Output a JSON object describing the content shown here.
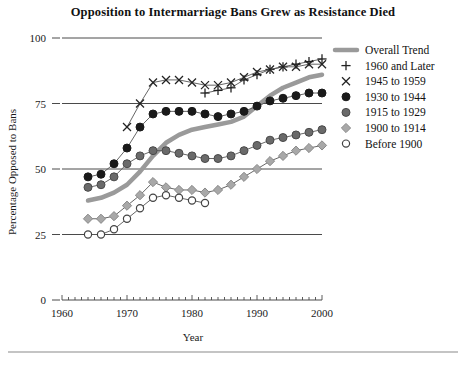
{
  "chart_data": {
    "type": "line",
    "title": "Opposition to Intermarriage Bans Grew as Resistance Died",
    "xlabel": "Year",
    "ylabel": "Percentage Opposed to Bans",
    "xlim": [
      1960,
      2000
    ],
    "ylim": [
      0,
      100
    ],
    "xticks": [
      1960,
      1970,
      1980,
      1990,
      2000
    ],
    "xtick_labels": [
      "1960",
      "1970",
      "1980",
      "1990",
      "2000"
    ],
    "yticks": [
      0,
      25,
      50,
      75,
      100
    ],
    "ytick_labels": [
      "0",
      "25",
      "50",
      "75",
      "100"
    ],
    "grid": "horizontal",
    "minor_xticks": true,
    "legend_position": "top-right",
    "series": [
      {
        "name": "Overall Trend",
        "marker": "line",
        "color": "#9a9a9a",
        "linewidth": 4.5,
        "x": [
          1964,
          1966,
          1968,
          1970,
          1972,
          1974,
          1976,
          1978,
          1980,
          1982,
          1984,
          1986,
          1988,
          1990,
          1992,
          1994,
          1996,
          1998,
          2000
        ],
        "y": [
          38,
          39,
          41,
          44,
          49,
          55,
          60,
          63,
          65,
          66,
          67,
          68,
          70,
          74,
          78,
          81,
          83,
          85,
          86
        ]
      },
      {
        "name": "1960 and Later",
        "marker": "plus",
        "color": "#2b2b2b",
        "x": [
          1982,
          1984,
          1986,
          1988,
          1990,
          1992,
          1994,
          1996,
          1998,
          2000
        ],
        "y": [
          79,
          80,
          81,
          84,
          86,
          88,
          89,
          90,
          91,
          92
        ]
      },
      {
        "name": "1945 to 1959",
        "marker": "x",
        "color": "#2b2b2b",
        "x": [
          1970,
          1972,
          1974,
          1976,
          1978,
          1980,
          1982,
          1984,
          1986,
          1988,
          1990,
          1992,
          1994,
          1996,
          1998,
          2000
        ],
        "y": [
          66,
          75,
          83,
          84,
          84,
          83,
          82,
          82,
          83,
          85,
          87,
          88,
          89,
          89,
          90,
          90
        ]
      },
      {
        "name": "1930 to 1944",
        "marker": "filled-circle",
        "color": "#1a1a1a",
        "x": [
          1964,
          1966,
          1968,
          1970,
          1972,
          1974,
          1976,
          1978,
          1980,
          1982,
          1984,
          1986,
          1988,
          1990,
          1992,
          1994,
          1996,
          1998,
          2000
        ],
        "y": [
          47,
          48,
          52,
          58,
          66,
          71,
          72,
          72,
          72,
          71,
          70,
          71,
          72,
          74,
          76,
          77,
          78,
          79,
          79
        ]
      },
      {
        "name": "1915 to 1929",
        "marker": "gray-circle",
        "color": "#6a6a6a",
        "x": [
          1964,
          1966,
          1968,
          1970,
          1972,
          1974,
          1976,
          1978,
          1980,
          1982,
          1984,
          1986,
          1988,
          1990,
          1992,
          1994,
          1996,
          1998,
          2000
        ],
        "y": [
          43,
          44,
          47,
          52,
          55,
          57,
          57,
          56,
          55,
          54,
          54,
          55,
          57,
          59,
          61,
          62,
          63,
          64,
          65
        ]
      },
      {
        "name": "1900 to 1914",
        "marker": "diamond",
        "color": "#a8a8a8",
        "x": [
          1964,
          1966,
          1968,
          1970,
          1972,
          1974,
          1976,
          1978,
          1980,
          1982,
          1984,
          1986,
          1988,
          1990,
          1992,
          1994,
          1996,
          1998,
          2000
        ],
        "y": [
          31,
          31,
          32,
          36,
          40,
          45,
          43,
          42,
          42,
          41,
          42,
          44,
          47,
          50,
          53,
          55,
          57,
          58,
          59
        ]
      },
      {
        "name": "Before 1900",
        "marker": "open-circle",
        "color": "#555555",
        "x": [
          1964,
          1966,
          1968,
          1970,
          1972,
          1974,
          1976,
          1978,
          1980,
          1982
        ],
        "y": [
          25,
          25,
          27,
          31,
          35,
          39,
          40,
          39,
          38,
          37
        ]
      }
    ]
  },
  "legend": {
    "entries": [
      {
        "label": "Overall Trend",
        "marker": "line"
      },
      {
        "label": "1960 and Later",
        "marker": "plus"
      },
      {
        "label": "1945 to 1959",
        "marker": "x"
      },
      {
        "label": "1930 to 1944",
        "marker": "filled-circle"
      },
      {
        "label": "1915 to 1929",
        "marker": "gray-circle"
      },
      {
        "label": "1900 to 1914",
        "marker": "diamond"
      },
      {
        "label": "Before 1900",
        "marker": "open-circle"
      }
    ]
  },
  "colors": {
    "overall_trend": "#9a9a9a",
    "dark": "#1a1a1a",
    "mid_gray": "#6a6a6a",
    "light_gray": "#a8a8a8",
    "gridline": "#55555"
  }
}
